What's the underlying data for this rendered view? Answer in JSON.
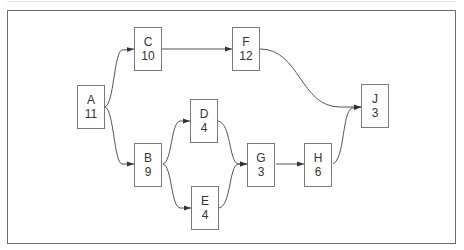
{
  "diagram": {
    "type": "activity-network",
    "nodes": [
      {
        "id": "A",
        "label": "A",
        "duration": "11",
        "x": 77,
        "y": 85
      },
      {
        "id": "B",
        "label": "B",
        "duration": "9",
        "x": 134,
        "y": 143
      },
      {
        "id": "C",
        "label": "C",
        "duration": "10",
        "x": 134,
        "y": 27
      },
      {
        "id": "D",
        "label": "D",
        "duration": "4",
        "x": 190,
        "y": 99
      },
      {
        "id": "E",
        "label": "E",
        "duration": "4",
        "x": 191,
        "y": 186
      },
      {
        "id": "F",
        "label": "F",
        "duration": "12",
        "x": 232,
        "y": 27
      },
      {
        "id": "G",
        "label": "G",
        "duration": "3",
        "x": 247,
        "y": 143
      },
      {
        "id": "H",
        "label": "H",
        "duration": "6",
        "x": 304,
        "y": 143
      },
      {
        "id": "J",
        "label": "J",
        "duration": "3",
        "x": 361,
        "y": 84
      }
    ],
    "edges": [
      {
        "from": "A",
        "to": "C"
      },
      {
        "from": "A",
        "to": "B"
      },
      {
        "from": "C",
        "to": "F"
      },
      {
        "from": "B",
        "to": "D"
      },
      {
        "from": "B",
        "to": "E"
      },
      {
        "from": "D",
        "to": "G"
      },
      {
        "from": "E",
        "to": "G"
      },
      {
        "from": "G",
        "to": "H"
      },
      {
        "from": "F",
        "to": "J"
      },
      {
        "from": "H",
        "to": "J"
      }
    ],
    "colors": {
      "line": "#555555",
      "box_border": "#7a7a7a",
      "text": "#333333",
      "frame": "#6a6a6a"
    }
  }
}
